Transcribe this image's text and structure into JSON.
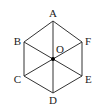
{
  "figure": {
    "center_label": "O",
    "vertices": [
      {
        "id": "A",
        "label": "A"
      },
      {
        "id": "F",
        "label": "F"
      },
      {
        "id": "E",
        "label": "E"
      },
      {
        "id": "D",
        "label": "D"
      },
      {
        "id": "C",
        "label": "C"
      },
      {
        "id": "B",
        "label": "B"
      }
    ],
    "diagonals": [
      [
        "A",
        "D"
      ],
      [
        "B",
        "E"
      ],
      [
        "C",
        "F"
      ]
    ],
    "colors": {
      "stroke": "#333333",
      "text": "#222222",
      "point": "#000000"
    }
  }
}
